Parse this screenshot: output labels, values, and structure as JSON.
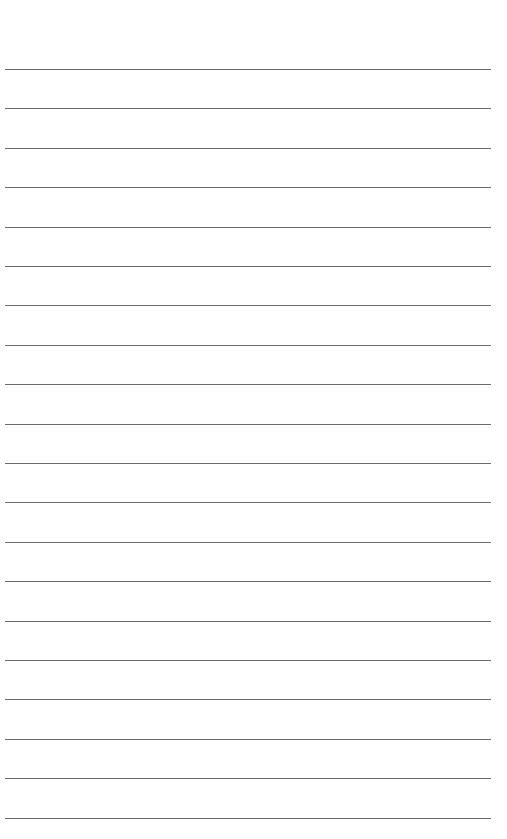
{
  "page": {
    "type": "lined-writing-page",
    "background_color": "#ffffff",
    "line_color": "#5a5a5a",
    "line_count": 20,
    "first_line_y": 69,
    "line_spacing": 39.4,
    "line_left": 5,
    "line_width": 486,
    "lines": [
      {
        "text": ""
      },
      {
        "text": ""
      },
      {
        "text": ""
      },
      {
        "text": ""
      },
      {
        "text": ""
      },
      {
        "text": ""
      },
      {
        "text": ""
      },
      {
        "text": ""
      },
      {
        "text": ""
      },
      {
        "text": ""
      },
      {
        "text": ""
      },
      {
        "text": ""
      },
      {
        "text": ""
      },
      {
        "text": ""
      },
      {
        "text": ""
      },
      {
        "text": ""
      },
      {
        "text": ""
      },
      {
        "text": ""
      },
      {
        "text": ""
      },
      {
        "text": ""
      }
    ]
  }
}
